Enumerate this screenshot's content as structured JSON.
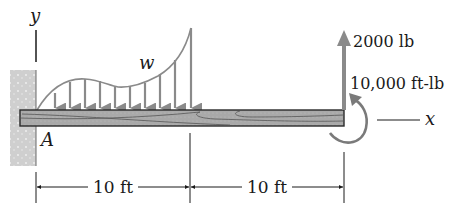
{
  "diagram": {
    "type": "cantilever beam free-body diagram",
    "axes": {
      "y_label": "y",
      "x_label": "x"
    },
    "support": {
      "label": "A",
      "type": "fixed wall"
    },
    "distributed_load": {
      "label": "w",
      "arrow_count": 10
    },
    "point_force": {
      "label": "2000 lb",
      "direction": "up"
    },
    "moment": {
      "label": "10,000 ft-lb",
      "direction": "counterclockwise"
    },
    "dimensions": [
      {
        "label": "10 ft"
      },
      {
        "label": "10 ft"
      }
    ],
    "colors": {
      "load": "#8a8a8a",
      "beam_fill": "#a9a9a9",
      "beam_outline": "#2a2a2a",
      "wall": "#cfcfcf",
      "text": "#1a1a1a"
    }
  }
}
